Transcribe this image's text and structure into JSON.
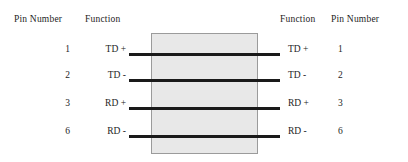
{
  "diagram": {
    "background_color": "#ffffff",
    "wire_color": "#1a1a1a",
    "body_fill_color": "#e8e8e8",
    "body_border_color": "#9b9b9b",
    "headers": {
      "left_pin": "Pin Number",
      "left_function": "Function",
      "right_function": "Function",
      "right_pin": "Pin Number"
    },
    "rows": [
      {
        "left_pin": "1",
        "left_function": "TD +",
        "right_function": "TD +",
        "right_pin": "1",
        "wire_y": 53,
        "label_y": 45
      },
      {
        "left_pin": "2",
        "left_function": "TD -",
        "right_function": "TD -",
        "right_pin": "2",
        "wire_y": 79,
        "label_y": 71
      },
      {
        "left_pin": "3",
        "left_function": "RD +",
        "right_function": "RD +",
        "right_pin": "3",
        "wire_y": 107,
        "label_y": 99
      },
      {
        "left_pin": "6",
        "left_function": "RD -",
        "right_function": "RD -",
        "right_pin": "6",
        "wire_y": 135,
        "label_y": 127
      }
    ]
  }
}
